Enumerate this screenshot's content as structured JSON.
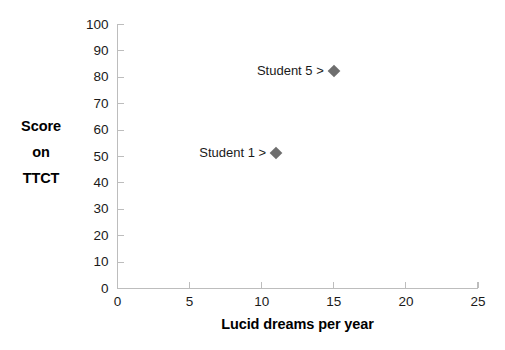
{
  "chart_data": {
    "type": "scatter",
    "title": "",
    "xlabel": "Lucid dreams per year",
    "ylabel_lines": [
      "Score",
      "on",
      "TTCT"
    ],
    "ylabel": "Score on TTCT",
    "xlim": [
      0,
      25
    ],
    "ylim": [
      0,
      100
    ],
    "xticks": [
      0,
      5,
      10,
      15,
      20,
      25
    ],
    "yticks": [
      0,
      10,
      20,
      30,
      40,
      50,
      60,
      70,
      80,
      90,
      100
    ],
    "xtick_labels": [
      "0",
      "5",
      "10",
      "15",
      "20",
      "25"
    ],
    "ytick_labels": [
      "0",
      "10",
      "20",
      "30",
      "40",
      "50",
      "60",
      "70",
      "80",
      "90",
      "100"
    ],
    "grid": false,
    "legend": false,
    "marker_shape": "diamond",
    "marker_color": "#6e6e6e",
    "axis_color": "#bdbdbd",
    "background_color": "#ffffff",
    "points": [
      {
        "label": "Student 1 >",
        "name": "Student 1",
        "x": 11,
        "y": 51.5
      },
      {
        "label": "Student 5 >",
        "name": "Student 5",
        "x": 15,
        "y": 82.5
      }
    ]
  }
}
